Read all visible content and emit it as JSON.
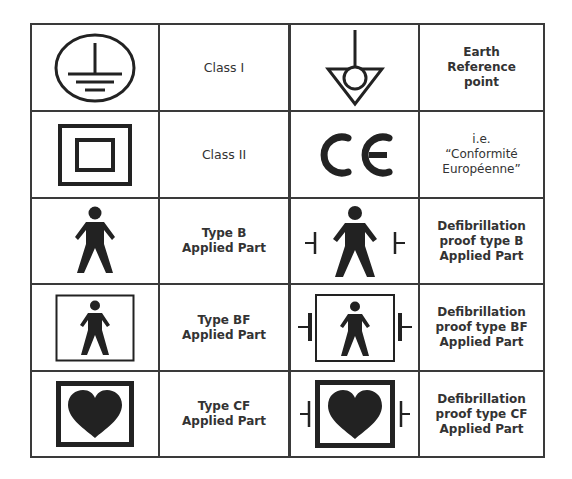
{
  "table": {
    "rows": [
      {
        "left": {
          "symbol": "protective-earth",
          "label": "Class I"
        },
        "right": {
          "symbol": "earth-reference-point",
          "label": "Earth\nReference\npoint"
        }
      },
      {
        "left": {
          "symbol": "double-insulation",
          "label": "Class II"
        },
        "right": {
          "symbol": "ce-mark",
          "label": "i.e.\n“Conformité\nEuropéenne”"
        }
      },
      {
        "left": {
          "symbol": "type-b-person",
          "label": "Type B\nApplied Part"
        },
        "right": {
          "symbol": "defib-type-b",
          "label": "Defibrillation\nproof type B\nApplied Part"
        }
      },
      {
        "left": {
          "symbol": "type-bf-person-boxed",
          "label": "Type BF\nApplied Part"
        },
        "right": {
          "symbol": "defib-type-bf",
          "label": "Defibrillation\nproof type BF\nApplied Part"
        }
      },
      {
        "left": {
          "symbol": "type-cf-heart-boxed",
          "label": "Type CF\nApplied Part"
        },
        "right": {
          "symbol": "defib-type-cf",
          "label": "Defibrillation\nproof type CF\nApplied Part"
        }
      }
    ],
    "line_color": "#3a3a3a",
    "symbol_color": "#222222"
  }
}
